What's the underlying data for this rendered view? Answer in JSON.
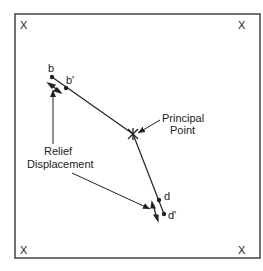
{
  "diagram": {
    "frame": {
      "x": 15,
      "y": 14,
      "w": 245,
      "h": 244,
      "stroke": "#444444"
    },
    "fiducials": [
      {
        "label": "X",
        "x": 25,
        "y": 29
      },
      {
        "label": "X",
        "x": 243,
        "y": 29
      },
      {
        "label": "X",
        "x": 25,
        "y": 254
      },
      {
        "label": "X",
        "x": 243,
        "y": 254
      }
    ],
    "points": {
      "b": {
        "label": "b",
        "x": 52,
        "y": 77
      },
      "b_prime": {
        "label": "b′",
        "x": 66,
        "y": 88
      },
      "principal": {
        "x": 133,
        "y": 134
      },
      "d": {
        "label": "d",
        "x": 159,
        "y": 200
      },
      "d_prime": {
        "label": "d′",
        "x": 164,
        "y": 214
      }
    },
    "labels": {
      "principal_point_line1": "Principal",
      "principal_point_line2": "Point",
      "relief_line1": "Relief",
      "relief_line2": "Displacement"
    },
    "colors": {
      "ink": "#222222",
      "background": "#ffffff"
    }
  }
}
